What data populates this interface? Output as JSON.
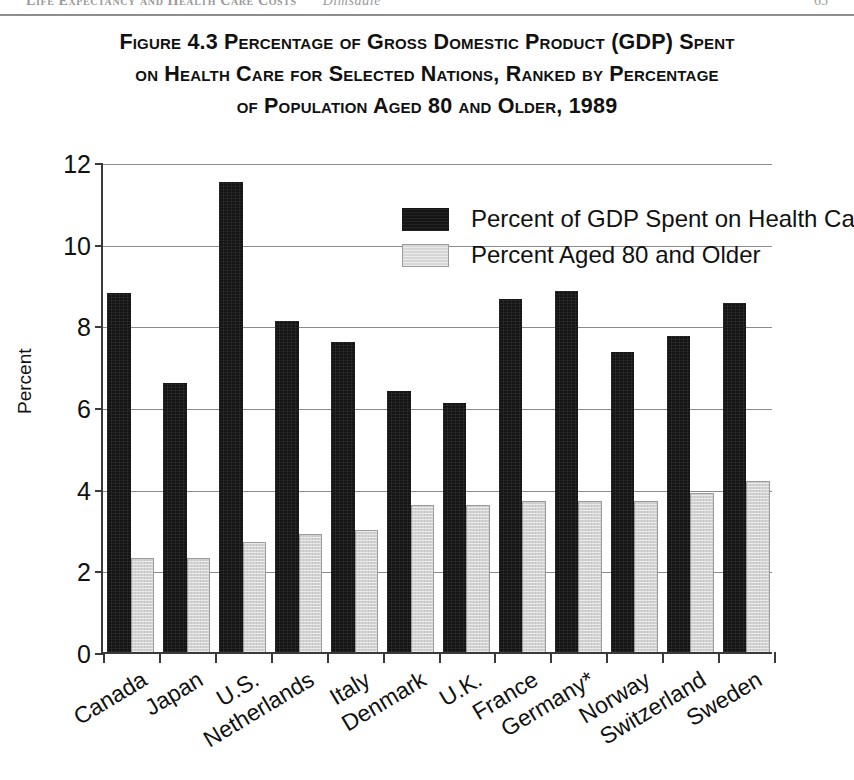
{
  "running_head": {
    "left_text": "Life Expectancy and Health Care Costs",
    "author": "Dimsdale",
    "page_number": "65"
  },
  "figure": {
    "title_lines": [
      "Figure 4.3  Percentage of Gross Domestic Product (GDP) Spent",
      "on Health Care for Selected Nations, Ranked by Percentage",
      "of Population Aged 80 and Older, 1989"
    ]
  },
  "chart_data": {
    "type": "bar",
    "title": "Figure 4.3  Percentage of Gross Domestic Product (GDP) Spent on Health Care for Selected Nations, Ranked by Percentage of Population Aged 80 and Older, 1989",
    "xlabel": "",
    "ylabel": "Percent",
    "ylim": [
      0,
      12
    ],
    "yticks": [
      0,
      2,
      4,
      6,
      8,
      10,
      12
    ],
    "ytick_labels": [
      "0",
      "2",
      "4",
      "6",
      "8",
      "10",
      "12"
    ],
    "grid": true,
    "legend_position": "upper right",
    "categories": [
      "Canada",
      "Japan",
      "U.S.",
      "Netherlands",
      "Italy",
      "Denmark",
      "U.K.",
      "France",
      "Germany*",
      "Norway",
      "Switzerland",
      "Sweden"
    ],
    "series": [
      {
        "name": "Percent of GDP Spent on Health Care",
        "color": "#151515",
        "values": [
          8.8,
          6.6,
          11.5,
          8.1,
          7.6,
          6.4,
          6.1,
          8.65,
          8.85,
          7.35,
          7.75,
          8.55
        ]
      },
      {
        "name": "Percent Aged 80 and Older",
        "color": "#d2d2d2",
        "values": [
          2.3,
          2.3,
          2.7,
          2.9,
          3.0,
          3.6,
          3.6,
          3.7,
          3.7,
          3.7,
          3.9,
          4.2
        ]
      }
    ]
  }
}
